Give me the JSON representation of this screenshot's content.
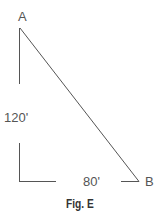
{
  "diagram": {
    "type": "right-triangle",
    "points": {
      "A": {
        "label": "A"
      },
      "B": {
        "label": "B"
      }
    },
    "dimensions": {
      "vertical": "120'",
      "horizontal": "80'"
    },
    "caption": "Fig. E",
    "colors": {
      "line": "#444444",
      "text": "#555555"
    }
  }
}
